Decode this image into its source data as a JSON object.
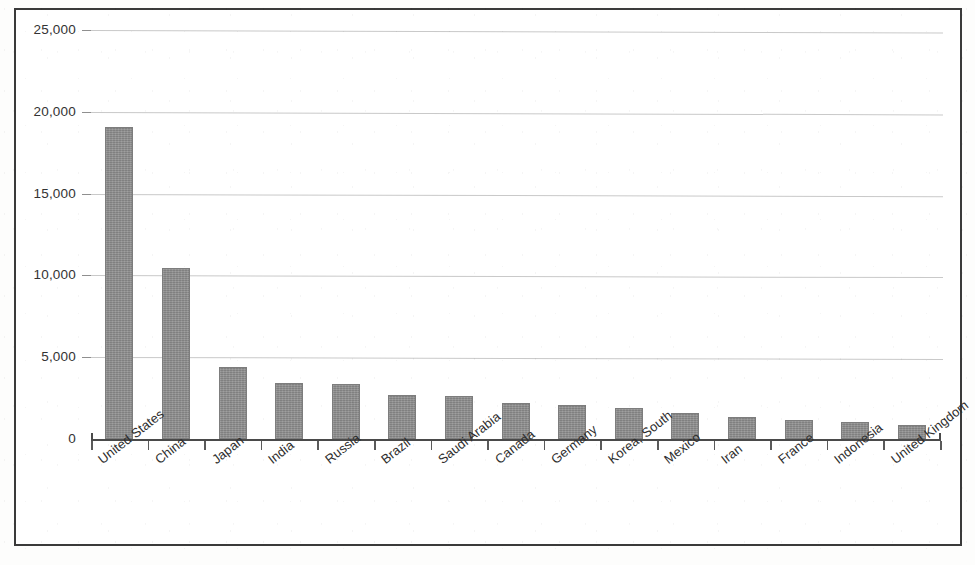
{
  "chart_data": {
    "type": "bar",
    "title": "",
    "subtitle": "",
    "xlabel": "",
    "ylabel": "",
    "ylim": [
      0,
      25000
    ],
    "ytick_labels": [
      "0",
      "5,000",
      "10,000",
      "15,000",
      "20,000",
      "25,000"
    ],
    "ytick_values": [
      0,
      5000,
      10000,
      15000,
      20000,
      25000
    ],
    "grid": true,
    "legend": false,
    "legend_position": "none",
    "categories": [
      "United States",
      "China",
      "Japan",
      "India",
      "Russia",
      "Brazil",
      "Saudi Arabia",
      "Canada",
      "Germany",
      "Korea, South",
      "Mexico",
      "Iran",
      "France",
      "Indonesia",
      "United Kingdom"
    ],
    "values": [
      19050,
      10450,
      4400,
      3420,
      3360,
      2690,
      2630,
      2200,
      2080,
      1900,
      1590,
      1345,
      1160,
      1040,
      855
    ],
    "bar_color": "#8c8c8c",
    "grid_color": "#c9c9c9",
    "axis_color": "#4a4a4a"
  },
  "frame": {
    "border_color": "#3a3a3a"
  }
}
